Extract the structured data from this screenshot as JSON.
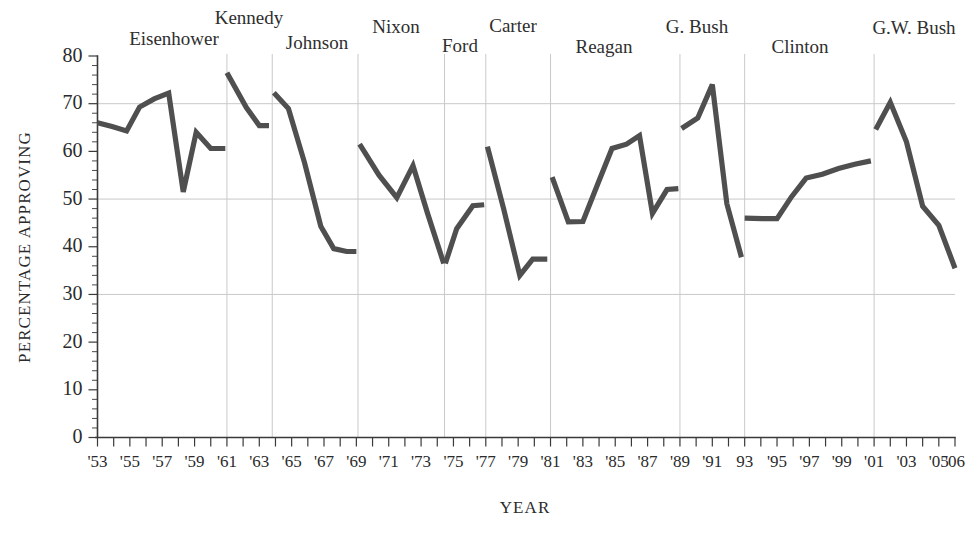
{
  "chart_data": {
    "type": "line",
    "title": "",
    "subtitle": "",
    "xlabel": "YEAR",
    "ylabel": "PERCENTAGE APPROVING",
    "xlim": [
      1953,
      2006
    ],
    "ylim": [
      0,
      80
    ],
    "grid": "horizontal gridlines at 30, 50, 70; vertical separators at presidential term boundaries",
    "legend": "none",
    "y_ticks": [
      0,
      10,
      20,
      30,
      40,
      50,
      60,
      70,
      80
    ],
    "y_tick_labels": [
      "0",
      "10",
      "20",
      "30",
      "40",
      "50",
      "60",
      "70",
      "80"
    ],
    "y_minor_tick_step": 2,
    "x_ticks": [
      1953,
      1954,
      1955,
      1956,
      1957,
      1958,
      1959,
      1960,
      1961,
      1962,
      1963,
      1964,
      1965,
      1966,
      1967,
      1968,
      1969,
      1970,
      1971,
      1972,
      1973,
      1974,
      1975,
      1976,
      1977,
      1978,
      1979,
      1980,
      1981,
      1982,
      1983,
      1984,
      1985,
      1986,
      1987,
      1988,
      1989,
      1990,
      1991,
      1992,
      1993,
      1994,
      1995,
      1996,
      1997,
      1998,
      1999,
      2000,
      2001,
      2002,
      2003,
      2004,
      2005,
      2006
    ],
    "x_tick_labels": [
      "'53",
      "",
      "'55",
      "",
      "'57",
      "",
      "'59",
      "",
      "'61",
      "",
      "'63",
      "",
      "'65",
      "",
      "'67",
      "",
      "'69",
      "",
      "'71",
      "",
      "'73",
      "",
      "'75",
      "",
      "'77",
      "",
      "'79",
      "",
      "'81",
      "",
      "'83",
      "",
      "'85",
      "",
      "'87",
      "",
      "'89",
      "",
      "'91",
      "",
      "93",
      "",
      "'95",
      "",
      "'97",
      "",
      "'99",
      "",
      "'01",
      "",
      "'03",
      "",
      "'05",
      "'06"
    ],
    "series": [
      {
        "name": "Presidential approval",
        "color": "#4f4f4f",
        "segments": [
          {
            "president": "Eisenhower",
            "x": [
              1953.0,
              1953.9,
              1954.8,
              1955.6,
              1956.5,
              1957.4,
              1958.3,
              1959.1,
              1960.0,
              1960.9
            ],
            "y": [
              66.0,
              65.2,
              64.3,
              69.3,
              71.0,
              72.2,
              51.5,
              64.0,
              60.6,
              60.6
            ]
          },
          {
            "president": "Kennedy",
            "x": [
              1961.0,
              1962.2,
              1963.0,
              1963.6
            ],
            "y": [
              76.5,
              69.2,
              65.4,
              65.4
            ]
          },
          {
            "president": "Johnson",
            "x": [
              1963.9,
              1964.8,
              1965.8,
              1966.8,
              1967.6,
              1968.4,
              1969.0
            ],
            "y": [
              72.3,
              69.0,
              57.6,
              44.3,
              39.6,
              39.0,
              39.0
            ]
          },
          {
            "president": "Nixon",
            "x": [
              1969.2,
              1970.4,
              1971.5,
              1972.5,
              1973.4,
              1974.4
            ],
            "y": [
              61.5,
              55.0,
              50.3,
              57.0,
              47.0,
              36.5
            ]
          },
          {
            "president": "Ford",
            "x": [
              1974.5,
              1975.2,
              1976.2,
              1976.9
            ],
            "y": [
              36.5,
              43.8,
              48.6,
              48.8
            ]
          },
          {
            "president": "Carter",
            "x": [
              1977.1,
              1978.1,
              1979.1,
              1979.9,
              1980.8
            ],
            "y": [
              61.0,
              48.0,
              34.0,
              37.4,
              37.4
            ]
          },
          {
            "president": "Reagan",
            "x": [
              1981.1,
              1982.1,
              1983.0,
              1983.9,
              1984.8,
              1985.7,
              1986.5,
              1987.3,
              1988.2,
              1988.9
            ],
            "y": [
              54.6,
              45.2,
              45.3,
              53.0,
              60.6,
              61.5,
              63.3,
              47.0,
              52.0,
              52.2
            ]
          },
          {
            "president": "G. Bush",
            "x": [
              1989.1,
              1990.1,
              1991.0,
              1991.9,
              1992.8
            ],
            "y": [
              64.8,
              67.0,
              74.0,
              49.0,
              37.8
            ]
          },
          {
            "president": "Clinton",
            "x": [
              1993.0,
              1994.1,
              1995.0,
              1995.9,
              1996.8,
              1997.8,
              1998.8,
              1999.8,
              2000.8
            ],
            "y": [
              46.0,
              45.9,
              45.9,
              50.5,
              54.4,
              55.2,
              56.4,
              57.3,
              58.0
            ]
          },
          {
            "president": "G.W. Bush",
            "x": [
              2001.1,
              2002.0,
              2003.0,
              2004.0,
              2005.0,
              2006.0
            ],
            "y": [
              64.6,
              70.3,
              62.0,
              48.5,
              44.5,
              35.5
            ]
          }
        ]
      }
    ],
    "term_dividers": [
      1961.0,
      1963.8,
      1969.1,
      1974.45,
      1977.0,
      1981.0,
      1989.0,
      1993.0,
      2001.0
    ],
    "h_gridlines": [
      30,
      50,
      70
    ],
    "annotations": [
      {
        "label": "Eisenhower",
        "x_center": 174,
        "y": 45
      },
      {
        "label": "Kennedy",
        "x_center": 249,
        "y": 24
      },
      {
        "label": "Johnson",
        "x_center": 317,
        "y": 49
      },
      {
        "label": "Nixon",
        "x_center": 396,
        "y": 33
      },
      {
        "label": "Ford",
        "x_center": 460,
        "y": 52
      },
      {
        "label": "Carter",
        "x_center": 513,
        "y": 32
      },
      {
        "label": "Reagan",
        "x_center": 604,
        "y": 53
      },
      {
        "label": "G. Bush",
        "x_center": 697,
        "y": 33
      },
      {
        "label": "Clinton",
        "x_center": 800,
        "y": 53
      },
      {
        "label": "G.W. Bush",
        "x_center": 914,
        "y": 34
      }
    ]
  },
  "axes": {
    "y_title": "PERCENTAGE APPROVING",
    "x_title": "YEAR"
  },
  "colors": {
    "line": "#4f4f4f",
    "grid": "#c9c9c9",
    "axis": "#3a3a3a",
    "text": "#2b2b2b",
    "background": "#ffffff"
  }
}
